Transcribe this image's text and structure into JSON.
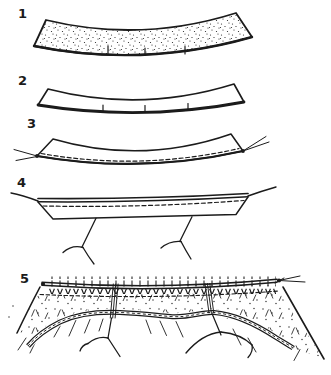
{
  "figure": {
    "background_color": "#ffffff",
    "ink_color": "#1b1b1b",
    "steps": [
      {
        "label": "1"
      },
      {
        "label": "2"
      },
      {
        "label": "3"
      },
      {
        "label": "4"
      },
      {
        "label": "5"
      }
    ]
  }
}
